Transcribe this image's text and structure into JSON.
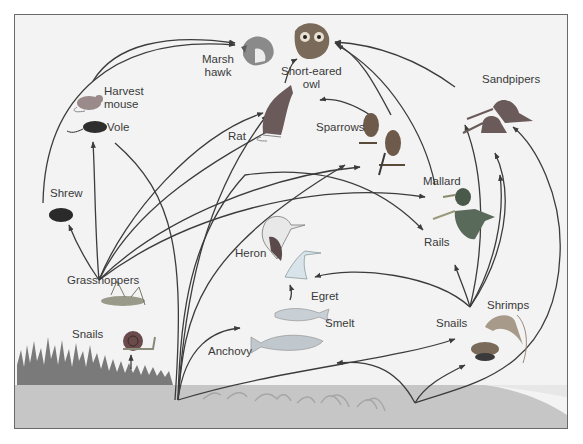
{
  "diagram": {
    "colors": {
      "background": "#f3f3f3",
      "frame": "#6a6a6a",
      "arrow": "#3c3c3c",
      "ground": "#c6c6c6",
      "marsh_grass": "#7a7a7a",
      "label": "#3a3a3a"
    },
    "organisms": [
      {
        "id": "marsh_hawk",
        "label_line1": "Marsh",
        "label_line2": "hawk"
      },
      {
        "id": "short_eared_owl",
        "label_line1": "Short-eared",
        "label_line2": "owl"
      },
      {
        "id": "harvest_mouse",
        "label_line1": "Harvest",
        "label_line2": "mouse"
      },
      {
        "id": "vole",
        "label": "Vole"
      },
      {
        "id": "rat",
        "label": "Rat"
      },
      {
        "id": "sparrows",
        "label": "Sparrows"
      },
      {
        "id": "sandpipers",
        "label": "Sandpipers"
      },
      {
        "id": "shrew",
        "label": "Shrew"
      },
      {
        "id": "mallard",
        "label": "Mallard"
      },
      {
        "id": "rails",
        "label": "Rails"
      },
      {
        "id": "heron",
        "label": "Heron"
      },
      {
        "id": "egret",
        "label": "Egret"
      },
      {
        "id": "grasshoppers",
        "label": "Grasshoppers"
      },
      {
        "id": "snails_land",
        "label": "Snails"
      },
      {
        "id": "smelt",
        "label": "Smelt"
      },
      {
        "id": "anchovy",
        "label": "Anchovy"
      },
      {
        "id": "shrimps",
        "label": "Shrimps"
      },
      {
        "id": "snails_water",
        "label": "Snails"
      }
    ],
    "producers": [
      "Marsh grass",
      "Algae / marine plants"
    ]
  }
}
